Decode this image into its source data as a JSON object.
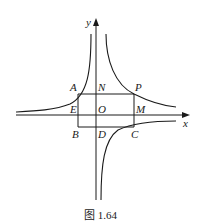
{
  "figure": {
    "caption": "图 1.64",
    "axes": {
      "x_label": "x",
      "y_label": "y"
    },
    "points": {
      "A": "A",
      "N": "N",
      "P": "P",
      "E": "E",
      "O": "O",
      "M": "M",
      "B": "B",
      "D": "D",
      "C": "C"
    },
    "curves": [
      "hyperbola branches in quadrants I, II, IV"
    ],
    "colors": {
      "stroke": "#1a1a1a",
      "background": "#ffffff"
    }
  }
}
